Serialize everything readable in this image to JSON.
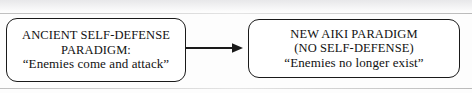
{
  "diagram": {
    "type": "flow",
    "background_color": "#fdfdfd",
    "stroke_color": "#1a1a1a",
    "nodes": [
      {
        "id": "ancient",
        "shape": "rounded-rectangle",
        "lines": [
          "ANCIENT SELF-DEFENSE",
          "PARADIGM:",
          "“Enemies come and attack”"
        ]
      },
      {
        "id": "aiki",
        "shape": "rounded-rectangle",
        "lines": [
          "NEW AIKI PARADIGM",
          "(NO SELF-DEFENSE)",
          "“Enemies no longer exist”"
        ]
      }
    ],
    "connector": {
      "id": "ancient-to-aiki",
      "style": "solid-line-with-arrowhead",
      "direction": "right"
    }
  }
}
